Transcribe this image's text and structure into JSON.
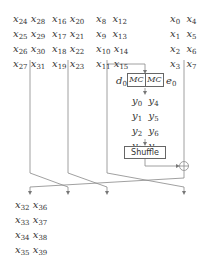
{
  "diagram": {
    "input_groups": [
      {
        "name": "group-a",
        "col1": [
          "24",
          "25",
          "26",
          "27"
        ],
        "col2": [
          "28",
          "29",
          "30",
          "31"
        ]
      },
      {
        "name": "group-b",
        "col1": [
          "16",
          "17",
          "18",
          "19"
        ],
        "col2": [
          "20",
          "21",
          "22",
          "23"
        ]
      },
      {
        "name": "group-c",
        "col1": [
          "8",
          "9",
          "10",
          "11"
        ],
        "col2": [
          "12",
          "13",
          "14",
          "15"
        ]
      },
      {
        "name": "group-d",
        "col1": [
          "0",
          "1",
          "2",
          "3"
        ],
        "col2": [
          "4",
          "5",
          "6",
          "7"
        ]
      }
    ],
    "input_var": "x",
    "mid_var": "y",
    "mid_group": {
      "col1": [
        "0",
        "1",
        "2",
        "3"
      ],
      "col2": [
        "4",
        "5",
        "6",
        "7"
      ]
    },
    "output_group": {
      "col1": [
        "32",
        "33",
        "34",
        "35"
      ],
      "col2": [
        "36",
        "37",
        "38",
        "39"
      ]
    },
    "mc_left_label": "MC",
    "mc_right_label": "MC",
    "d_label": "d",
    "d_sub": "0",
    "e_label": "e",
    "e_sub": "0",
    "shuffle_label": "Shuffle",
    "xor_symbol": "⊕",
    "line_color": "#777777",
    "text_color": "#333333"
  }
}
